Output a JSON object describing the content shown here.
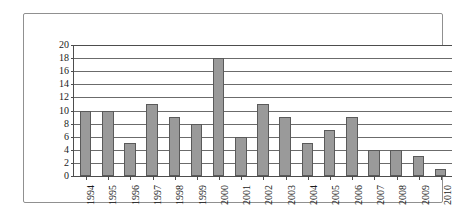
{
  "chart_data": {
    "type": "bar",
    "title": "",
    "subtitle": "",
    "xlabel": "",
    "ylabel": "",
    "categories": [
      "1994",
      "1995",
      "1996",
      "1997",
      "1998",
      "1999",
      "2000",
      "2001",
      "2002",
      "2003",
      "2004",
      "2005",
      "2006",
      "2007",
      "2008",
      "2009",
      "2010"
    ],
    "values": [
      10,
      10,
      5,
      11,
      9,
      8,
      18,
      6,
      11,
      9,
      5,
      7,
      9,
      4,
      4,
      3,
      1
    ],
    "series": [
      {
        "name": "",
        "values": [
          10,
          10,
          5,
          11,
          9,
          8,
          18,
          6,
          11,
          9,
          5,
          7,
          9,
          4,
          4,
          3,
          1
        ]
      }
    ],
    "ylim": [
      0,
      20
    ],
    "ytick_labels": [
      "0",
      "2",
      "4",
      "6",
      "8",
      "10",
      "12",
      "14",
      "16",
      "18",
      "20"
    ],
    "ytick_values": [
      0,
      2,
      4,
      6,
      8,
      10,
      12,
      14,
      16,
      18,
      20
    ],
    "ytick_step": 2,
    "xtick_labels": [
      "1994",
      "1995",
      "1996",
      "1997",
      "1998",
      "1999",
      "2000",
      "2001",
      "2002",
      "2003",
      "2004",
      "2005",
      "2006",
      "2007",
      "2008",
      "2009",
      "2010"
    ],
    "xtick_rotation": -90,
    "grid": true,
    "grid_axis": "y",
    "legend": false,
    "legend_position": "none",
    "annotations": [],
    "colors": {
      "bar_fill": "#9a9a9a",
      "bar_border": "#5a5a5a",
      "gridline": "#6b6b6b",
      "axis": "#4d4d4d",
      "frame_border": "#909090",
      "background": "#ffffff",
      "text": "#1a1a1a"
    }
  }
}
